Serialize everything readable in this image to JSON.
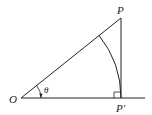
{
  "diagram": {
    "type": "geometry",
    "labels": {
      "origin": "O",
      "point": "P",
      "projection": "P′",
      "angle": "θ"
    },
    "points": {
      "O": [
        21,
        98
      ],
      "P": [
        121,
        18
      ],
      "P_prime": [
        121,
        98
      ]
    },
    "elements": [
      "ray OP",
      "horizontal axis through O",
      "perpendicular from P to P′",
      "arc centered at O from OP to P′",
      "right-angle marker at P′",
      "angle θ at O with arrow"
    ],
    "colors": {
      "stroke": "#222222",
      "background": "#ffffff"
    }
  }
}
